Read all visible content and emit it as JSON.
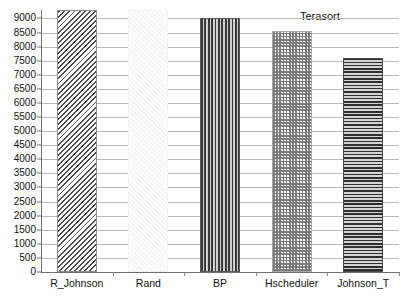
{
  "chart_data": {
    "type": "bar",
    "title": "Terasort",
    "xlabel": "",
    "ylabel": "",
    "categories": [
      "R_Johnson",
      "Rand",
      "BP",
      "Hscheduler",
      "Johnson_T"
    ],
    "values": [
      9300,
      9300,
      9000,
      8550,
      7600
    ],
    "ylim": [
      0,
      9300
    ],
    "yticks": [
      0,
      500,
      1000,
      1500,
      2000,
      2500,
      3000,
      3500,
      4000,
      4500,
      5000,
      5500,
      6000,
      6500,
      7000,
      7500,
      8000,
      8500,
      9000
    ],
    "ytick_labels": [
      "0",
      "500",
      "1000",
      "1500",
      "2000",
      "2500",
      "3000",
      "3500",
      "4000",
      "4500",
      "5000",
      "5500",
      "6000",
      "6500",
      "7000",
      "7500",
      "8000",
      "8500",
      "9000"
    ],
    "grid": true,
    "legend": false,
    "legend_position": "none",
    "series": [
      {
        "name": "Terasort",
        "values": [
          9300,
          9300,
          9000,
          8550,
          7600
        ],
        "patterns": [
          "diagonal-hatch",
          "blank-light",
          "vertical-stripes",
          "checkerboard",
          "horizontal-stripes"
        ]
      }
    ],
    "colors": {
      "gridline": "#b9b9b9",
      "axis": "#6e6e6e",
      "text": "#111111",
      "background": "#ffffff"
    }
  }
}
